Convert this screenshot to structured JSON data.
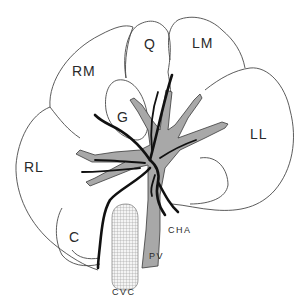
{
  "diagram": {
    "type": "anatomical-liver-lobes",
    "colors": {
      "outline": "#4a4a4a",
      "portal_vein": "#a8a8a8",
      "artery": "#111111",
      "vena_cava_hatch": "#9a9a9a",
      "label": "#2a2a2a"
    },
    "lobe_labels": {
      "rm": "RM",
      "q": "Q",
      "lm": "LM",
      "ll": "LL",
      "g": "G",
      "rl": "RL",
      "c": "C"
    },
    "vessel_labels": {
      "cha": "CHA",
      "pv": "PV",
      "cvc": "CVC"
    }
  }
}
